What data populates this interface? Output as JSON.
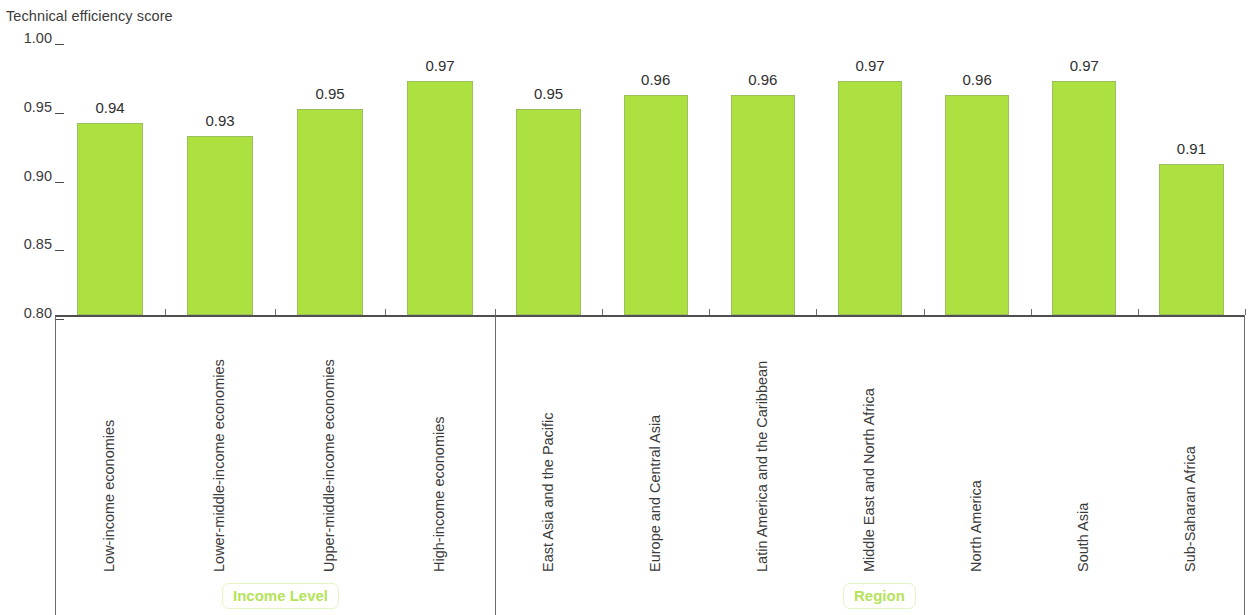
{
  "chart_data": {
    "type": "bar",
    "title": "Technical efficiency score",
    "xlabel": "",
    "ylabel": "Technical efficiency score",
    "ylim": [
      0.8,
      1.0
    ],
    "ytick_labels": [
      "1.00",
      "0.95",
      "0.90",
      "0.85",
      "0.80"
    ],
    "ytick_values": [
      1.0,
      0.95,
      0.9,
      0.85,
      0.8
    ],
    "grid": false,
    "legend": null,
    "bar_color": "#ADE13F",
    "bar_border_color": "#9cbf62",
    "group_label_color": "#b5e35a",
    "groups": [
      {
        "name": "Income Level",
        "categories": [
          "Low-income economies",
          "Lower-middle-income economies",
          "Upper-middle-income economies",
          "High-income economies"
        ],
        "values": [
          0.94,
          0.93,
          0.95,
          0.97
        ],
        "value_labels": [
          "0.94",
          "0.93",
          "0.95",
          "0.97"
        ]
      },
      {
        "name": "Region",
        "categories": [
          "East Asia and the Pacific",
          "Europe and Central Asia",
          "Latin America and the Caribbean",
          "Middle East and North Africa",
          "North America",
          "South Asia",
          "Sub-Saharan Africa"
        ],
        "values": [
          0.95,
          0.96,
          0.96,
          0.97,
          0.96,
          0.97,
          0.91
        ],
        "value_labels": [
          "0.95",
          "0.96",
          "0.96",
          "0.97",
          "0.96",
          "0.97",
          "0.91"
        ]
      }
    ],
    "categories": [
      "Low-income economies",
      "Lower-middle-income economies",
      "Upper-middle-income economies",
      "High-income economies",
      "East Asia and the Pacific",
      "Europe and Central Asia",
      "Latin America and the Caribbean",
      "Middle East and North Africa",
      "North America",
      "South Asia",
      "Sub-Saharan Africa"
    ],
    "values": [
      0.94,
      0.93,
      0.95,
      0.97,
      0.95,
      0.96,
      0.96,
      0.97,
      0.96,
      0.97,
      0.91
    ]
  }
}
